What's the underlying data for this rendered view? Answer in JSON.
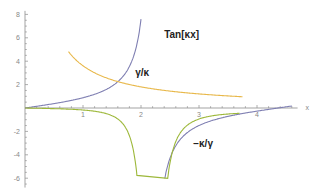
{
  "chart_data": {
    "type": "line",
    "title": "",
    "xlabel": "x",
    "ylabel": "",
    "xlim": [
      0,
      4.7
    ],
    "ylim": [
      -6.8,
      8.3
    ],
    "xticks": [
      1,
      2,
      3,
      4
    ],
    "yticks": [
      -6,
      -4,
      -2,
      2,
      4,
      6,
      8
    ],
    "grid": false,
    "series": [
      {
        "name": "Tan[κx]",
        "color": "#7f7fb2",
        "function": "tan(kappa*x)",
        "kappa": 0.72
      },
      {
        "name": "γ/κ",
        "color": "#e8b84a",
        "function": "gamma/(kappa*x)",
        "gamma": 2.6
      },
      {
        "name": "−κ/γ",
        "color": "#9db83a",
        "function": "-(kappa*x)/gamma"
      }
    ],
    "annotations": [
      {
        "text": "Tan[κx]",
        "x": 2.4,
        "y": 6.0
      },
      {
        "text": "γ/κ",
        "x": 1.9,
        "y": 2.7
      },
      {
        "text": "−κ/γ",
        "x": 2.9,
        "y": -3.3
      }
    ]
  }
}
